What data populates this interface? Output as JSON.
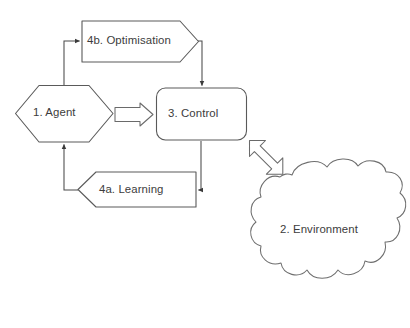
{
  "diagram": {
    "background_color": "#ffffff",
    "stroke_color": "#5a5a5a",
    "text_color": "#3c3c3c",
    "nodes": [
      {
        "id": "agent",
        "label": "1. Agent",
        "shape": "hexagon",
        "icon": "hexagon-shape-icon"
      },
      {
        "id": "environment",
        "label": "2. Environment",
        "shape": "cloud",
        "icon": "cloud-shape-icon"
      },
      {
        "id": "control",
        "label": "3. Control",
        "shape": "rounded-rectangle",
        "icon": "rounded-rectangle-shape-icon"
      },
      {
        "id": "learning",
        "label": "4a. Learning",
        "shape": "left-chevron",
        "icon": "left-chevron-shape-icon"
      },
      {
        "id": "optimisation",
        "label": "4b. Optimisation",
        "shape": "right-pentagon-arrow",
        "icon": "right-pentagon-shape-icon"
      }
    ],
    "connectors": [
      {
        "id": "agent-to-optimisation",
        "from": "agent",
        "to": "optimisation",
        "style": "elbow-line",
        "arrowheads": "single",
        "icon": "arrow-right-icon"
      },
      {
        "id": "optimisation-to-control",
        "from": "optimisation",
        "to": "control",
        "style": "elbow-line",
        "arrowheads": "single",
        "icon": "arrow-down-icon"
      },
      {
        "id": "agent-to-control",
        "from": "agent",
        "to": "control",
        "style": "hollow-block-arrow",
        "arrowheads": "single",
        "icon": "block-arrow-right-icon"
      },
      {
        "id": "control-to-learning",
        "from": "control",
        "to": "learning",
        "style": "elbow-line",
        "arrowheads": "single",
        "icon": "arrow-left-icon"
      },
      {
        "id": "learning-to-agent",
        "from": "learning",
        "to": "agent",
        "style": "elbow-line",
        "arrowheads": "single",
        "icon": "arrow-up-icon"
      },
      {
        "id": "control-to-environment",
        "from": "control",
        "to": "environment",
        "style": "hollow-block-arrow",
        "arrowheads": "double",
        "icon": "block-arrow-double-diagonal-icon"
      }
    ]
  }
}
